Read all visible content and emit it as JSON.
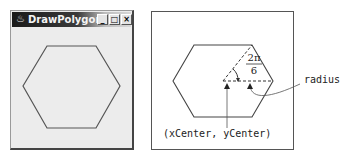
{
  "window": {
    "title": "DrawPolygon",
    "icon": "java-coffee-cup-icon",
    "buttons": {
      "minimize": "_",
      "maximize": "□",
      "close": "×"
    }
  },
  "diagram": {
    "angle_numerator": "2π",
    "angle_denominator": "6",
    "radius_label": "radius",
    "center_label": "(xCenter, yCenter)"
  },
  "colors": {
    "line": "#555555",
    "titlebar_dark": "#1a1a1a",
    "window_bg": "#ececec"
  }
}
